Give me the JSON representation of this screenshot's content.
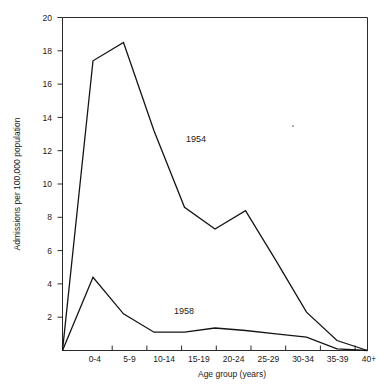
{
  "chart_data": {
    "type": "line",
    "title": "",
    "xlabel": "Age group (years)",
    "ylabel": "Admissions per 100,000 population",
    "categories": [
      "",
      "0-4",
      "5-9",
      "10-14",
      "15-19",
      "20-24",
      "25-29",
      "30-34",
      "35-39",
      "40+",
      ""
    ],
    "x_tick_labels": [
      "0-4",
      "5-9",
      "10-14",
      "15-19",
      "20-24",
      "25-29",
      "30-34",
      "35-39",
      "40+"
    ],
    "y_tick_labels": [
      "2",
      "4",
      "6",
      "8",
      "10",
      "12",
      "14",
      "16",
      "18",
      "20"
    ],
    "y_ticks": [
      2,
      4,
      6,
      8,
      10,
      12,
      14,
      16,
      18,
      20
    ],
    "ylim": [
      0,
      20
    ],
    "grid": false,
    "legend": "inline-annotations",
    "series": [
      {
        "name": "1954",
        "label": "1954",
        "categories": [
          "",
          "0-4",
          "5-9",
          "10-14",
          "15-19",
          "20-24",
          "25-29",
          "30-34",
          "35-39",
          "40+",
          ""
        ],
        "values": [
          0.0,
          17.4,
          18.5,
          13.2,
          8.6,
          7.3,
          8.4,
          5.4,
          2.3,
          0.6,
          0.0
        ]
      },
      {
        "name": "1958",
        "label": "1958",
        "categories": [
          "",
          "0-4",
          "5-9",
          "10-14",
          "15-19",
          "20-24",
          "25-29",
          "30-34",
          "35-39",
          "40+",
          ""
        ],
        "values": [
          0.0,
          4.4,
          2.2,
          1.1,
          1.1,
          1.35,
          1.2,
          1.0,
          0.8,
          0.1,
          0.0
        ]
      }
    ]
  },
  "axes": {
    "y_axis_title": "Admissions per 100,000 population",
    "x_axis_title": "Age group (years)"
  },
  "annotations": {
    "series_1954": "1954",
    "series_1958": "1958"
  }
}
